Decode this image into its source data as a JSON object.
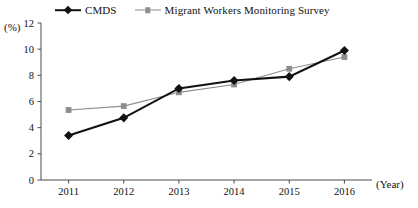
{
  "chart_data": {
    "type": "line",
    "title": "",
    "xlabel": "(Year)",
    "ylabel": "(%)",
    "categories": [
      "2011",
      "2012",
      "2013",
      "2014",
      "2015",
      "2016"
    ],
    "x": [
      2011,
      2012,
      2013,
      2014,
      2015,
      2016
    ],
    "ylim": [
      0,
      12
    ],
    "yticks": [
      0,
      2,
      4,
      6,
      8,
      10,
      12
    ],
    "ytick_labels": [
      "0",
      "2",
      "4",
      "6",
      "8",
      "10",
      "12"
    ],
    "grid": false,
    "legend_position": "top",
    "series": [
      {
        "name": "CMDS",
        "color": "#111111",
        "marker": "diamond",
        "values": [
          3.4,
          4.75,
          7.0,
          7.6,
          7.9,
          9.9
        ]
      },
      {
        "name": "Migrant Workers Monitoring Survey",
        "color": "#8d8d8d",
        "marker": "square",
        "values": [
          5.35,
          5.65,
          6.7,
          7.3,
          8.5,
          9.4
        ]
      }
    ]
  },
  "legend": {
    "entries": [
      {
        "label": "CMDS"
      },
      {
        "label": "Migrant Workers Monitoring Survey"
      }
    ]
  },
  "axes": {
    "y_unit": "(%)",
    "x_unit": "(Year)"
  },
  "colors": {
    "cmds": "#111111",
    "survey": "#8d8d8d",
    "axis": "#4a4a4a",
    "background": "#ffffff"
  }
}
